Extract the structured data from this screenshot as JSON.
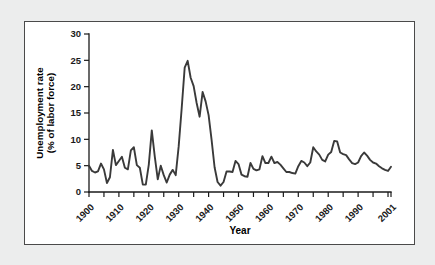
{
  "figure": {
    "panel_background": "#ffffff",
    "page_background": "#eceded",
    "border_color": "#4a4a4a",
    "line_color": "#3a3a3a"
  },
  "chart_data": {
    "type": "line",
    "title": "",
    "subtitle": "",
    "xlabel": "Year",
    "ylabel": "Unemployment rate (% of labor force)",
    "ylabel_line1": "Unemployment rate",
    "ylabel_line2": "(% of labor force)",
    "ylim": [
      0,
      30
    ],
    "xlim": [
      1900,
      2001
    ],
    "ytick_values": [
      0,
      5,
      10,
      15,
      20,
      25,
      30
    ],
    "ytick_labels": [
      "0",
      "5",
      "10",
      "15",
      "20",
      "25",
      "30"
    ],
    "xtick_values": [
      1900,
      1905,
      1910,
      1915,
      1920,
      1925,
      1930,
      1935,
      1940,
      1945,
      1950,
      1955,
      1960,
      1965,
      1970,
      1975,
      1980,
      1985,
      1990,
      1995,
      2000
    ],
    "xtick_labeled": [
      1900,
      1910,
      1920,
      1930,
      1940,
      1950,
      1960,
      1970,
      1980,
      1990,
      2001
    ],
    "xtick_labels": [
      "1900",
      "1910",
      "1920",
      "1930",
      "1940",
      "1950",
      "1960",
      "1970",
      "1980",
      "1990",
      "2001"
    ],
    "xtick_label_rotation": -45,
    "grid": false,
    "legend": false,
    "legend_position": "none",
    "series": [
      {
        "name": "Unemployment rate",
        "color": "#3a3a3a",
        "x": [
          1900,
          1901,
          1902,
          1903,
          1904,
          1905,
          1906,
          1907,
          1908,
          1909,
          1910,
          1911,
          1912,
          1913,
          1914,
          1915,
          1916,
          1917,
          1918,
          1919,
          1920,
          1921,
          1922,
          1923,
          1924,
          1925,
          1926,
          1927,
          1928,
          1929,
          1930,
          1931,
          1932,
          1933,
          1934,
          1935,
          1936,
          1937,
          1938,
          1939,
          1940,
          1941,
          1942,
          1943,
          1944,
          1945,
          1946,
          1947,
          1948,
          1949,
          1950,
          1951,
          1952,
          1953,
          1954,
          1955,
          1956,
          1957,
          1958,
          1959,
          1960,
          1961,
          1962,
          1963,
          1964,
          1965,
          1966,
          1967,
          1968,
          1969,
          1970,
          1971,
          1972,
          1973,
          1974,
          1975,
          1976,
          1977,
          1978,
          1979,
          1980,
          1981,
          1982,
          1983,
          1984,
          1985,
          1986,
          1987,
          1988,
          1989,
          1990,
          1991,
          1992,
          1993,
          1994,
          1995,
          1996,
          1997,
          1998,
          1999,
          2000,
          2001
        ],
        "values": [
          5.0,
          4.0,
          3.7,
          3.9,
          5.4,
          4.3,
          1.7,
          2.8,
          8.0,
          5.1,
          5.9,
          6.7,
          4.6,
          4.3,
          7.9,
          8.5,
          5.1,
          4.6,
          1.4,
          1.4,
          5.2,
          11.7,
          6.7,
          2.4,
          5.0,
          3.2,
          1.8,
          3.3,
          4.2,
          3.2,
          8.7,
          15.9,
          23.6,
          24.9,
          21.7,
          20.1,
          16.9,
          14.3,
          19.0,
          17.2,
          14.6,
          9.9,
          4.7,
          1.9,
          1.2,
          1.9,
          3.9,
          3.9,
          3.8,
          5.9,
          5.3,
          3.3,
          3.0,
          2.9,
          5.5,
          4.4,
          4.1,
          4.3,
          6.8,
          5.5,
          5.5,
          6.7,
          5.5,
          5.7,
          5.2,
          4.5,
          3.8,
          3.8,
          3.6,
          3.5,
          4.9,
          5.9,
          5.6,
          4.9,
          5.6,
          8.5,
          7.7,
          7.1,
          6.1,
          5.8,
          7.1,
          7.6,
          9.7,
          9.6,
          7.5,
          7.2,
          7.0,
          6.2,
          5.5,
          5.3,
          5.6,
          6.8,
          7.5,
          6.9,
          6.1,
          5.6,
          5.4,
          4.9,
          4.5,
          4.2,
          4.0,
          4.8
        ]
      }
    ],
    "annotations": []
  }
}
